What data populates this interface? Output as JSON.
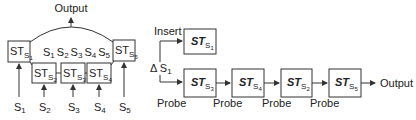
{
  "left_diagram": {
    "output_label": "Output",
    "center_label": "S₁ S₂ S₃ S₄ S₅",
    "center_parts": [
      "S",
      "1",
      "S",
      "2",
      "S",
      "3",
      "S",
      "4",
      "S",
      "5"
    ],
    "operators": [
      {
        "id": "ST_S1",
        "main": "ST",
        "sub": "S",
        "subsub": "1"
      },
      {
        "id": "ST_S2",
        "main": "ST",
        "sub": "S",
        "subsub": "2"
      },
      {
        "id": "ST_S3",
        "main": "ST",
        "sub": "S",
        "subsub": "3"
      },
      {
        "id": "ST_S4",
        "main": "ST",
        "sub": "S",
        "subsub": "4"
      },
      {
        "id": "ST_S5",
        "main": "ST",
        "sub": "S",
        "subsub": "5"
      }
    ],
    "inputs": [
      {
        "main": "S",
        "sub": "1"
      },
      {
        "main": "S",
        "sub": "2"
      },
      {
        "main": "S",
        "sub": "3"
      },
      {
        "main": "S",
        "sub": "4"
      },
      {
        "main": "S",
        "sub": "5"
      }
    ]
  },
  "right_diagram": {
    "delta_label": "Δ S",
    "delta_sub": "1",
    "insert_label": "Insert",
    "insert_box": {
      "main": "ST",
      "sub": "S",
      "subsub": "1"
    },
    "chain": [
      {
        "main": "ST",
        "sub": "S",
        "subsub": "3"
      },
      {
        "main": "ST",
        "sub": "S",
        "subsub": "4"
      },
      {
        "main": "ST",
        "sub": "S",
        "subsub": "2"
      },
      {
        "main": "ST",
        "sub": "S",
        "subsub": "5"
      }
    ],
    "probe_labels": [
      "Probe",
      "Probe",
      "Probe",
      "Probe"
    ],
    "output_label": "Output"
  }
}
